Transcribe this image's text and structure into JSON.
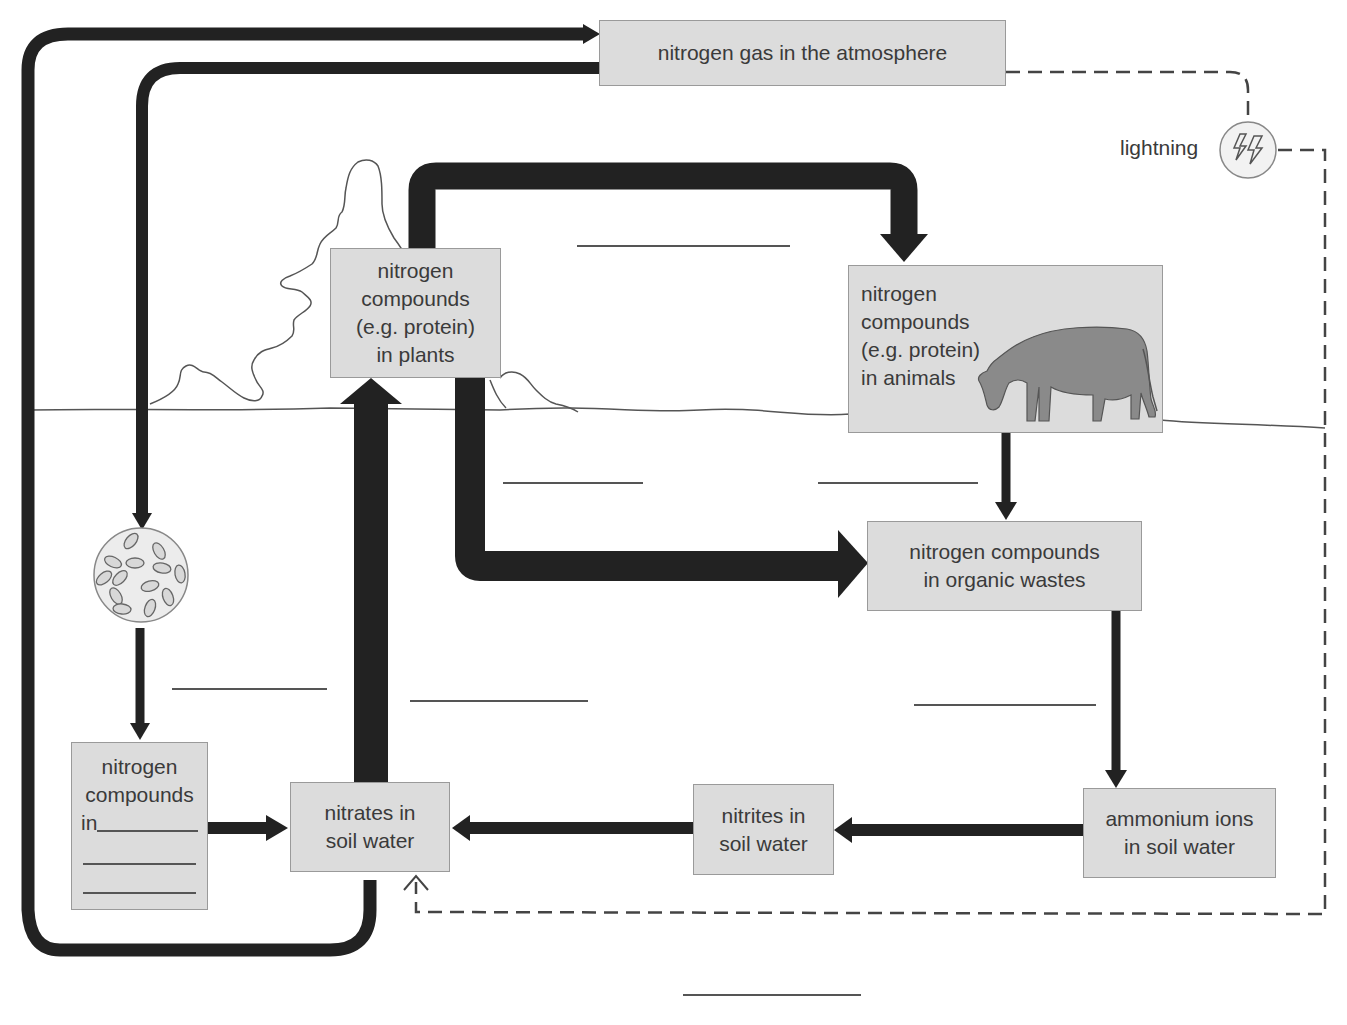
{
  "diagram": {
    "colors": {
      "box_fill": "#dcdcdc",
      "box_border": "#9a9a9a",
      "arrow": "#222222",
      "text": "#3a3a3a",
      "dashed_line": "#444444",
      "cow_fill": "#8a8a8a"
    },
    "nodes": {
      "atmosphere": {
        "lines": [
          "nitrogen gas in the atmosphere"
        ]
      },
      "plants": {
        "lines": [
          "nitrogen",
          "compounds",
          "(e.g. protein)",
          "in plants"
        ]
      },
      "animals": {
        "lines": [
          "nitrogen",
          "compounds",
          "(e.g. protein)",
          "in animals"
        ],
        "illustration": "cow-icon"
      },
      "organic_wastes": {
        "lines": [
          "nitrogen compounds",
          "in organic wastes"
        ]
      },
      "ammonium": {
        "lines": [
          "ammonium ions",
          "in soil water"
        ]
      },
      "nitrites": {
        "lines": [
          "nitrites in",
          "soil water"
        ]
      },
      "nitrates": {
        "lines": [
          "nitrates in",
          "soil water"
        ]
      },
      "fixed_compounds": {
        "lines": [
          "nitrogen",
          "compounds",
          "in"
        ],
        "blank_lines": 3
      },
      "bacteria": {
        "icon": "bacteria-icon"
      },
      "lightning": {
        "label": "lightning",
        "icon": "lightning-icon"
      }
    },
    "blank_labels": [
      {
        "id": "plants-to-animals",
        "x": 577,
        "y": 245,
        "width": 213
      },
      {
        "id": "plants-to-wastes-left",
        "x": 503,
        "y": 482,
        "width": 140
      },
      {
        "id": "animals-to-wastes",
        "x": 818,
        "y": 482,
        "width": 160
      },
      {
        "id": "bacteria-to-compounds",
        "x": 172,
        "y": 688,
        "width": 155
      },
      {
        "id": "nitrates-to-plants",
        "x": 410,
        "y": 700,
        "width": 178
      },
      {
        "id": "wastes-to-ammonium",
        "x": 914,
        "y": 704,
        "width": 182
      },
      {
        "id": "nitrates-to-atmosphere",
        "x": 683,
        "y": 994,
        "width": 178
      }
    ],
    "arrows": [
      {
        "from": "nitrates",
        "to": "atmosphere",
        "style": "thick"
      },
      {
        "from": "atmosphere",
        "to": "bacteria",
        "style": "thick"
      },
      {
        "from": "bacteria",
        "to": "fixed_compounds",
        "style": "thick"
      },
      {
        "from": "fixed_compounds",
        "to": "nitrates",
        "style": "thick"
      },
      {
        "from": "nitrates",
        "to": "plants",
        "style": "very-thick"
      },
      {
        "from": "plants",
        "to": "animals",
        "style": "very-thick"
      },
      {
        "from": "plants",
        "to": "organic_wastes",
        "style": "very-thick"
      },
      {
        "from": "animals",
        "to": "organic_wastes",
        "style": "medium"
      },
      {
        "from": "organic_wastes",
        "to": "ammonium",
        "style": "medium"
      },
      {
        "from": "ammonium",
        "to": "nitrites",
        "style": "medium"
      },
      {
        "from": "nitrites",
        "to": "nitrates",
        "style": "medium"
      },
      {
        "from": "atmosphere",
        "to": "nitrates",
        "via": "lightning",
        "style": "dashed"
      }
    ]
  }
}
